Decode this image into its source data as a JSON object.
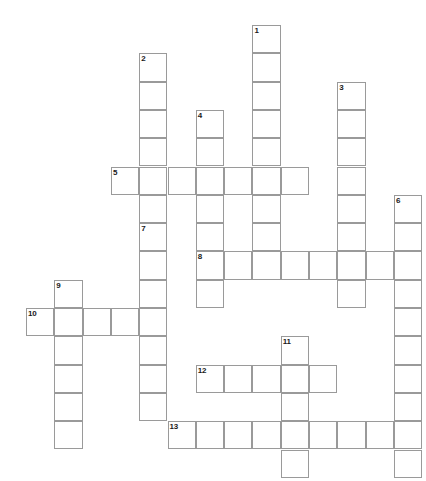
{
  "puzzle": {
    "title": "",
    "type": "crossword-grid",
    "grid_origin": {
      "x": 26,
      "y": 25
    },
    "cell_size": 28.3,
    "cell_border_color": "#9a9a9a",
    "cell_fill_color": "#ffffff",
    "background_color": "#ffffff",
    "number_color": "#1a1a1a",
    "columns": 14,
    "rows": 16,
    "entries": [
      {
        "number": "1",
        "direction": "down",
        "col": 8,
        "row": 0,
        "length": 9
      },
      {
        "number": "2",
        "direction": "down",
        "col": 4,
        "row": 1,
        "length": 6
      },
      {
        "number": "3",
        "direction": "down",
        "col": 11,
        "row": 2,
        "length": 8
      },
      {
        "number": "4",
        "direction": "down",
        "col": 6,
        "row": 3,
        "length": 7
      },
      {
        "number": "5",
        "direction": "across",
        "col": 3,
        "row": 5,
        "length": 7
      },
      {
        "number": "6",
        "direction": "down",
        "col": 13,
        "row": 6,
        "length": 10
      },
      {
        "number": "7",
        "direction": "down",
        "col": 4,
        "row": 7,
        "length": 7
      },
      {
        "number": "8",
        "direction": "across",
        "col": 6,
        "row": 8,
        "length": 8
      },
      {
        "number": "9",
        "direction": "down",
        "col": 1,
        "row": 9,
        "length": 6
      },
      {
        "number": "10",
        "direction": "across",
        "col": 0,
        "row": 10,
        "length": 5
      },
      {
        "number": "11",
        "direction": "down",
        "col": 9,
        "row": 11,
        "length": 5
      },
      {
        "number": "12",
        "direction": "across",
        "col": 6,
        "row": 12,
        "length": 5
      },
      {
        "number": "13",
        "direction": "across",
        "col": 5,
        "row": 14,
        "length": 9
      }
    ],
    "numbers": [
      {
        "label": "1",
        "col": 8,
        "row": 0
      },
      {
        "label": "2",
        "col": 4,
        "row": 1
      },
      {
        "label": "3",
        "col": 11,
        "row": 2
      },
      {
        "label": "4",
        "col": 6,
        "row": 3
      },
      {
        "label": "5",
        "col": 3,
        "row": 5
      },
      {
        "label": "6",
        "col": 13,
        "row": 6
      },
      {
        "label": "7",
        "col": 4,
        "row": 7
      },
      {
        "label": "8",
        "col": 6,
        "row": 8
      },
      {
        "label": "9",
        "col": 1,
        "row": 9
      },
      {
        "label": "10",
        "col": 0,
        "row": 10
      },
      {
        "label": "11",
        "col": 9,
        "row": 11
      },
      {
        "label": "12",
        "col": 6,
        "row": 12
      },
      {
        "label": "13",
        "col": 5,
        "row": 14
      }
    ]
  }
}
